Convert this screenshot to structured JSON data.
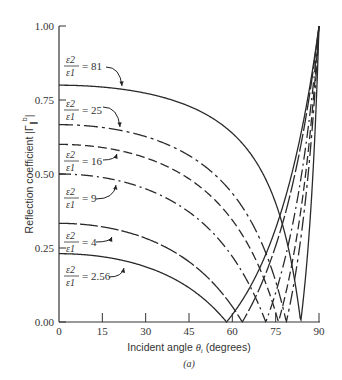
{
  "chart_data": {
    "type": "line",
    "title": "",
    "caption": "(a)",
    "xlabel": "Incident angle θi (degrees)",
    "xlabel_parts": {
      "pre": "Incident angle ",
      "theta": "θ",
      "sub": "i",
      "post": " (degrees)"
    },
    "ylabel": "Reflection coefficient |Γ∥b|",
    "ylabel_parts": {
      "pre": "Reflection coefficient |Γ",
      "sup": "b",
      "sub": "∥",
      "post": "|"
    },
    "xlim": [
      0,
      90
    ],
    "ylim": [
      0,
      1.0
    ],
    "xticks": [
      0,
      15,
      30,
      45,
      60,
      75,
      90
    ],
    "xtick_labels": [
      "0",
      "15",
      "30",
      "45",
      "60",
      "75",
      "90"
    ],
    "yticks": [
      0,
      0.25,
      0.5,
      0.75,
      1.0
    ],
    "ytick_labels": [
      "0.00",
      "0.25",
      "0.50",
      "0.75",
      "1.00"
    ],
    "grid": false,
    "legend": "inline annotations with arrows",
    "x": [
      0,
      15,
      30,
      45,
      60,
      75,
      90
    ],
    "series": [
      {
        "name": "ε2/ε1 = 81",
        "eps_ratio": 81,
        "style": "solid",
        "brewster_angle": 83.7,
        "values": [
          0.8,
          0.79,
          0.77,
          0.73,
          0.64,
          0.4,
          1.0
        ]
      },
      {
        "name": "ε2/ε1 = 25",
        "eps_ratio": 25,
        "style": "dashdot-long",
        "brewster_angle": 78.7,
        "values": [
          0.67,
          0.66,
          0.63,
          0.58,
          0.45,
          0.12,
          1.0
        ]
      },
      {
        "name": "ε2/ε1 = 16",
        "eps_ratio": 16,
        "style": "dashed",
        "brewster_angle": 76.0,
        "values": [
          0.6,
          0.59,
          0.56,
          0.5,
          0.36,
          0.03,
          1.0
        ]
      },
      {
        "name": "ε2/ε1 = 9",
        "eps_ratio": 9,
        "style": "dashdot",
        "brewster_angle": 71.6,
        "values": [
          0.5,
          0.49,
          0.45,
          0.39,
          0.23,
          0.12,
          1.0
        ]
      },
      {
        "name": "ε2/ε1 = 4",
        "eps_ratio": 4,
        "style": "longdash",
        "brewster_angle": 63.4,
        "values": [
          0.33,
          0.32,
          0.29,
          0.22,
          0.05,
          0.26,
          1.0
        ]
      },
      {
        "name": "ε2/ε1 = 2.56",
        "eps_ratio": 2.56,
        "style": "solid",
        "brewster_angle": 58.0,
        "values": [
          0.23,
          0.22,
          0.19,
          0.12,
          0.02,
          0.31,
          1.0
        ]
      }
    ]
  },
  "annotations": [
    {
      "num": "ε2",
      "den": "ε1",
      "value": "= 81",
      "lx": 64,
      "ly": 66,
      "ax1": 106,
      "ay1": 67,
      "ax2": 122,
      "ay2": 86
    },
    {
      "num": "ε2",
      "den": "ε1",
      "value": "= 25",
      "lx": 64,
      "ly": 110,
      "ax1": 103,
      "ay1": 107,
      "ax2": 120,
      "ay2": 127
    },
    {
      "num": "ε2",
      "den": "ε1",
      "value": "= 16",
      "lx": 64,
      "ly": 161,
      "ax1": 103,
      "ay1": 160,
      "ax2": 117,
      "ay2": 154
    },
    {
      "num": "ε2",
      "den": "ε1",
      "value": "= 9",
      "lx": 64,
      "ly": 198,
      "ax1": 96,
      "ay1": 199,
      "ax2": 116,
      "ay2": 185
    },
    {
      "num": "ε2",
      "den": "ε1",
      "value": "= 4",
      "lx": 64,
      "ly": 242,
      "ax1": 96,
      "ay1": 242,
      "ax2": 112,
      "ay2": 237
    },
    {
      "num": "ε2",
      "den": "ε1",
      "value": "= 2.56",
      "lx": 64,
      "ly": 276,
      "ax1": 109,
      "ay1": 277,
      "ax2": 124,
      "ay2": 268
    }
  ]
}
